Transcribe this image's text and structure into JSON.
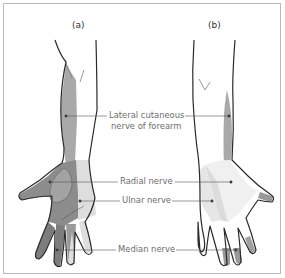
{
  "figure": {
    "panels": [
      {
        "id": "a",
        "label": "(a)",
        "view": "palmar"
      },
      {
        "id": "b",
        "label": "(b)",
        "view": "dorsal"
      }
    ],
    "labels": {
      "lateral_cutaneous_line1": "Lateral cutaneous",
      "lateral_cutaneous_line2": "nerve of forearm",
      "radial": "Radial nerve",
      "ulnar": "Ulnar nerve",
      "median": "Median nerve"
    },
    "colors": {
      "outline": "#2a2a2a",
      "lateral_cutaneous_shade": "#a9a9a9",
      "radial_shade": "#9a9a9a",
      "median_shade": "#7d7d7d",
      "ulnar_shade": "#dedede",
      "leader_line": "#555555",
      "frame": "#b9b9b9"
    }
  }
}
